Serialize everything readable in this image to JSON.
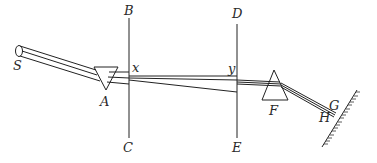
{
  "figure": {
    "type": "optics-experiment-diagram",
    "labels": {
      "source": "S",
      "prism_first": "A",
      "board_first_top": "B",
      "board_first_bottom": "C",
      "hole_first": "x",
      "board_second_top": "D",
      "board_second_bottom": "E",
      "hole_second": "y",
      "prism_second": "F",
      "wall_point_upper": "G",
      "wall_point_lower": "H"
    },
    "components": [
      {
        "id": "S",
        "kind": "light-source-aperture"
      },
      {
        "id": "A",
        "kind": "prism",
        "orientation": "inverted"
      },
      {
        "id": "BC",
        "kind": "board-with-hole",
        "hole": "x"
      },
      {
        "id": "DE",
        "kind": "board-with-hole",
        "hole": "y"
      },
      {
        "id": "F",
        "kind": "prism",
        "orientation": "upright"
      },
      {
        "id": "GH",
        "kind": "wall-screen"
      }
    ],
    "colors": {
      "line": "#222222",
      "background": "#ffffff"
    }
  }
}
